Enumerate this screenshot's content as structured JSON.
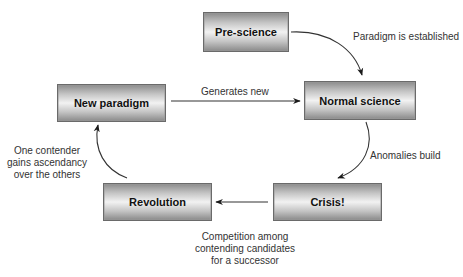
{
  "diagram": {
    "type": "cycle-flowchart",
    "nodes": [
      {
        "id": "pre-science",
        "label": "Pre-science"
      },
      {
        "id": "normal-science",
        "label": "Normal science"
      },
      {
        "id": "crisis",
        "label": "Crisis!"
      },
      {
        "id": "revolution",
        "label": "Revolution"
      },
      {
        "id": "new-paradigm",
        "label": "New paradigm"
      }
    ],
    "edges": [
      {
        "from": "pre-science",
        "to": "normal-science",
        "label": "Paradigm is established"
      },
      {
        "from": "normal-science",
        "to": "crisis",
        "label": "Anomalies build"
      },
      {
        "from": "crisis",
        "to": "revolution",
        "label_lines": [
          "Competition among",
          "contending candidates",
          "for a successor"
        ]
      },
      {
        "from": "revolution",
        "to": "new-paradigm",
        "label_lines": [
          "One contender",
          "gains ascendancy",
          "over the others"
        ]
      },
      {
        "from": "new-paradigm",
        "to": "normal-science",
        "label": "Generates new"
      }
    ]
  }
}
